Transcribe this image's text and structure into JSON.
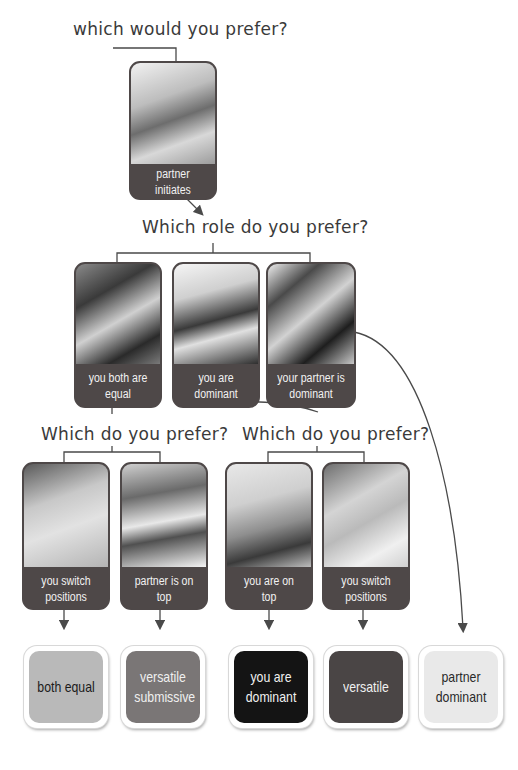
{
  "questions": {
    "q1": "which would you prefer?",
    "q2": "Which role do you prefer?",
    "q3_left": "Which do you prefer?",
    "q3_right": "Which do you prefer?"
  },
  "cards": {
    "partner_initiates": {
      "label": "partner initiates",
      "image": "couple-embrace-photo"
    },
    "both_equal": {
      "label": "you both are equal",
      "image": "couple-embrace-photo"
    },
    "you_dominant": {
      "label": "you are dominant",
      "image": "woman-over-man-photo"
    },
    "partner_dominant": {
      "label": "your partner is dominant",
      "image": "man-behind-woman-photo"
    },
    "switch_positions_left": {
      "label": "you switch positions",
      "image": "couple-smiling-photo"
    },
    "partner_on_top": {
      "label": "partner is on top",
      "image": "man-over-woman-photo"
    },
    "you_on_top": {
      "label": "you are on top",
      "image": "woman-over-man-photo"
    },
    "switch_positions_right": {
      "label": "you switch positions",
      "image": "couple-kissing-photo"
    }
  },
  "results": [
    {
      "label": "both equal",
      "bg": "#b9b9b9",
      "fg": "#1c1c1c"
    },
    {
      "label": "versatile submissive",
      "bg": "#7a7676",
      "fg": "#f0f0f0"
    },
    {
      "label": "you are dominant",
      "bg": "#141414",
      "fg": "#f0f0f0"
    },
    {
      "label": "versatile",
      "bg": "#4a4545",
      "fg": "#f0f0f0"
    },
    {
      "label": "partner dominant",
      "bg": "#e9e9e9",
      "fg": "#2a2a2a"
    }
  ],
  "colors": {
    "card": "#4e4848",
    "line": "#4a4a4a",
    "text": "#3a3a3a"
  }
}
